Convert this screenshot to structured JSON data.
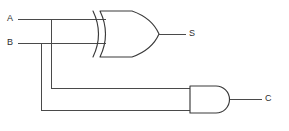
{
  "diagram": {
    "background_color": "#ffffff",
    "line_color": "#4a4a4a",
    "gate_color": "#3a3a3a",
    "label_color": "#2e2e2e",
    "width": 289,
    "height": 131
  },
  "labels": {
    "input_a": "A",
    "input_b": "B",
    "output_s": "S",
    "output_c": "C"
  },
  "gates": [
    {
      "id": "xor",
      "type": "XOR",
      "inputs": [
        "A",
        "B"
      ],
      "output": "S",
      "x": 90,
      "y": 10,
      "width": 70,
      "height": 48
    },
    {
      "id": "and",
      "type": "AND",
      "inputs": [
        "A",
        "B"
      ],
      "output": "C",
      "x": 190,
      "y": 86,
      "width": 52,
      "height": 27
    }
  ],
  "nets": [
    {
      "name": "A",
      "from": "input-a",
      "to": [
        "xor.in1",
        "and.in1"
      ],
      "y": 19
    },
    {
      "name": "B",
      "from": "input-b",
      "to": [
        "xor.in2",
        "and.in2"
      ],
      "y": 43
    },
    {
      "name": "S",
      "from": "xor.out",
      "to": [
        "output-s"
      ],
      "y": 34
    },
    {
      "name": "C",
      "from": "and.out",
      "to": [
        "output-c"
      ],
      "y": 99
    }
  ]
}
